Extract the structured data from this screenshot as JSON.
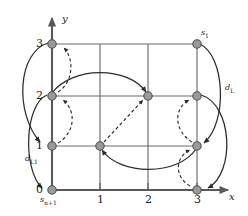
{
  "figure": {
    "title": "",
    "axes": {
      "x_label": "x",
      "y_label": "y",
      "x_ticks": [
        "0",
        "1",
        "2",
        "3"
      ],
      "y_ticks": [
        "0",
        "1",
        "2",
        "3"
      ],
      "x_range": [
        0,
        3
      ],
      "y_range": [
        0,
        3
      ],
      "grid": true,
      "axis_color": "#595959"
    },
    "annotations": {
      "node_top_right": "s",
      "node_top_right_sub": "1",
      "node_bottom_left": "s",
      "node_bottom_left_sub": "n+1",
      "dist_right": "d",
      "dist_right_sub": "L",
      "dist_left": "d",
      "dist_left_sub": "L1"
    },
    "colors": {
      "node_fill": "#9a9a9a",
      "node_stroke": "#4d4d4d",
      "grid_line": "#6b6b6b",
      "arrow_solid": "#2b2b2b",
      "arrow_dashed": "#2b2b2b",
      "text": "#1a1a1a"
    },
    "nodes": [
      {
        "x": 0,
        "y": 0,
        "name": "node-0-0"
      },
      {
        "x": 0,
        "y": 1,
        "name": "node-0-1"
      },
      {
        "x": 0,
        "y": 2,
        "name": "node-0-2"
      },
      {
        "x": 0,
        "y": 3,
        "name": "node-0-3"
      },
      {
        "x": 1,
        "y": 1,
        "name": "node-1-1"
      },
      {
        "x": 2,
        "y": 2,
        "name": "node-2-2"
      },
      {
        "x": 3,
        "y": 0,
        "name": "node-3-0"
      },
      {
        "x": 3,
        "y": 1,
        "name": "node-3-1"
      },
      {
        "x": 3,
        "y": 2,
        "name": "node-3-2"
      },
      {
        "x": 3,
        "y": 3,
        "name": "node-3-3"
      }
    ],
    "grid_lines": {
      "vertical_x": [
        0,
        1,
        2,
        3
      ],
      "horizontal_y": [
        0,
        1,
        2,
        3
      ]
    },
    "arrows": [
      {
        "style": "solid",
        "from": [
          0,
          3
        ],
        "to": [
          0,
          1
        ],
        "name": "arrow-solid-outer-left-top"
      },
      {
        "style": "solid",
        "from": [
          0,
          2
        ],
        "to": [
          0,
          0
        ],
        "name": "arrow-solid-left-mid"
      },
      {
        "style": "solid",
        "from": [
          0,
          2
        ],
        "to": [
          2,
          2
        ],
        "name": "arrow-solid-row2"
      },
      {
        "style": "solid",
        "from": [
          3,
          1
        ],
        "to": [
          1,
          1
        ],
        "name": "arrow-solid-row1"
      },
      {
        "style": "solid",
        "from": [
          3,
          3
        ],
        "to": [
          3,
          1
        ],
        "name": "arrow-solid-right-top"
      },
      {
        "style": "solid",
        "from": [
          3,
          2
        ],
        "to": [
          3,
          0
        ],
        "name": "arrow-solid-right-mid"
      },
      {
        "style": "dashed",
        "from": [
          0,
          2
        ],
        "to": [
          0,
          3
        ],
        "name": "arrow-dashed-left-up-1"
      },
      {
        "style": "dashed",
        "from": [
          0,
          1
        ],
        "to": [
          0,
          2
        ],
        "name": "arrow-dashed-left-up-2"
      },
      {
        "style": "dashed",
        "from": [
          1,
          1
        ],
        "to": [
          2,
          2
        ],
        "name": "arrow-dashed-diagonal"
      },
      {
        "style": "dashed",
        "from": [
          3,
          1
        ],
        "to": [
          3,
          2
        ],
        "name": "arrow-dashed-right-up-1"
      },
      {
        "style": "dashed",
        "from": [
          3,
          0
        ],
        "to": [
          3,
          1
        ],
        "name": "arrow-dashed-right-up-2"
      }
    ]
  }
}
